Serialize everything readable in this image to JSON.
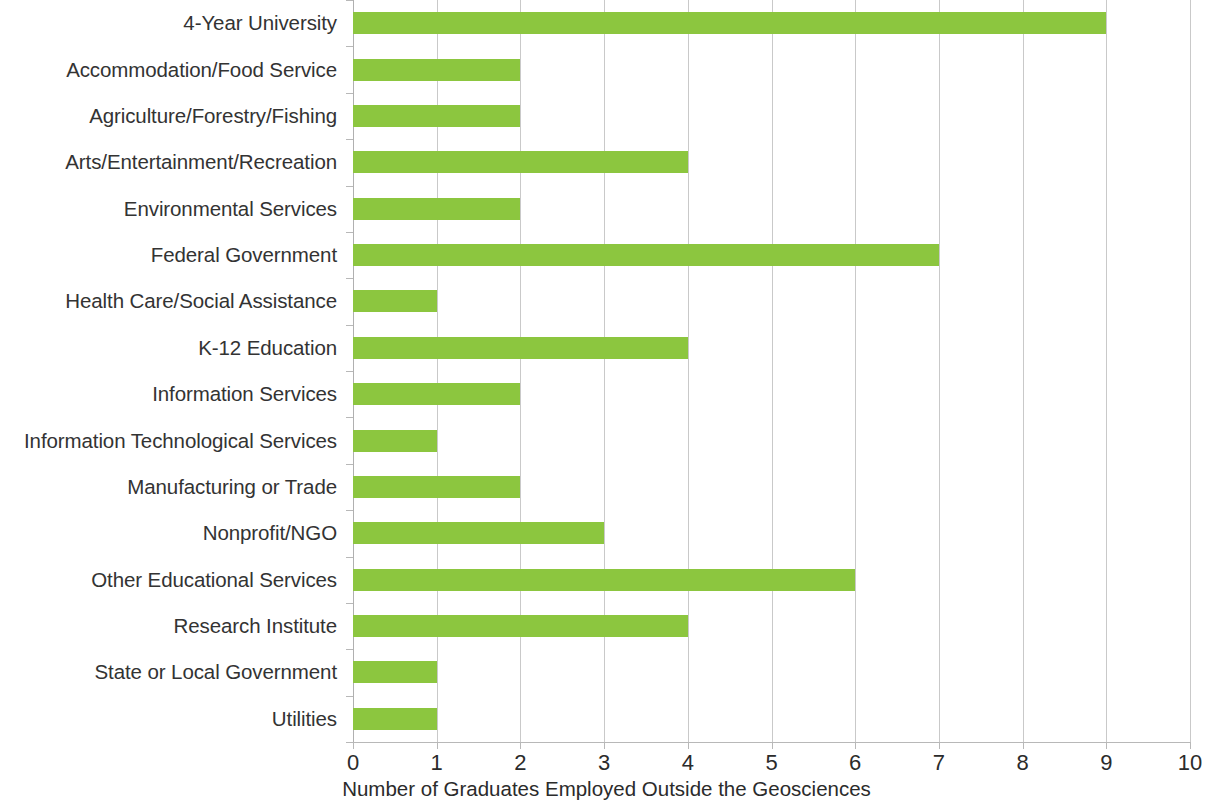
{
  "chart_data": {
    "type": "bar",
    "orientation": "horizontal",
    "title": "",
    "xlabel": "Number of Graduates Employed Outside the Geosciences",
    "ylabel": "",
    "xlim": [
      0,
      10
    ],
    "xticks": [
      "0",
      "1",
      "2",
      "3",
      "4",
      "5",
      "6",
      "7",
      "8",
      "9",
      "10"
    ],
    "grid": "vertical",
    "legend": "none",
    "bar_color": "#8CC63F",
    "categories": [
      "4-Year University",
      "Accommodation/Food Service",
      "Agriculture/Forestry/Fishing",
      "Arts/Entertainment/Recreation",
      "Environmental Services",
      "Federal Government",
      "Health Care/Social Assistance",
      "K-12 Education",
      "Information Services",
      "Information Technological Services",
      "Manufacturing or Trade",
      "Nonprofit/NGO",
      "Other Educational Services",
      "Research Institute",
      "State or Local Government",
      "Utilities"
    ],
    "values": [
      9,
      2,
      2,
      4,
      2,
      7,
      1,
      4,
      2,
      1,
      2,
      3,
      6,
      4,
      1,
      1
    ]
  }
}
